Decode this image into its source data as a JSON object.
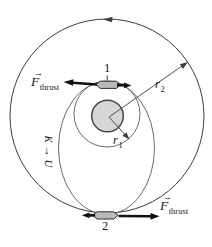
{
  "colors": {
    "background": "#fefefe",
    "line": "#3d3d3d",
    "thin_orbit": "#5a5a5a",
    "planet_fill": "#d6d6d6",
    "planet_stroke": "#474747",
    "spacecraft_fill": "#b9b9b9",
    "spacecraft_stroke": "#2e2e2e",
    "arrow_black": "#111111"
  },
  "labels": {
    "point1": "1",
    "point2": "2",
    "radius_inner": {
      "symbol": "r",
      "sub": "1"
    },
    "radius_outer": {
      "symbol": "r",
      "sub": "2"
    },
    "thrust_top": {
      "vector_arrow": "→",
      "symbol": "F",
      "sub": "thrust"
    },
    "thrust_bottom": {
      "vector_arrow": "→",
      "symbol": "F",
      "sub": "thrust"
    },
    "energy_conversion": "K → U"
  }
}
